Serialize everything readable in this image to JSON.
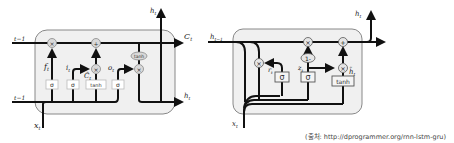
{
  "lstm": {
    "name": "LSTM cell",
    "inputs": {
      "c_prev": "cₜ₋₁",
      "h_prev": "hₜ₋₁",
      "x": "xₜ"
    },
    "outputs": {
      "c": "Cₜ",
      "h_top": "hₜ",
      "h_right": "hₜ"
    },
    "gates": [
      {
        "id": "forget",
        "box": "σ",
        "label": "fₜ"
      },
      {
        "id": "input",
        "box": "σ",
        "label": "iₜ"
      },
      {
        "id": "candidate",
        "box": "tanh",
        "label": "C̃ₜ"
      },
      {
        "id": "output",
        "box": "σ",
        "label": "oₜ"
      }
    ],
    "ops": {
      "mul": "×",
      "add": "+",
      "tanh": "tanh"
    },
    "top_left_label": "t−1",
    "bottom_left_label": "t−1"
  },
  "gru": {
    "name": "GRU cell",
    "inputs": {
      "h_prev": "hₜ₋₁",
      "x": "xₜ"
    },
    "outputs": {
      "h_top": "hₜ"
    },
    "gates": [
      {
        "id": "reset",
        "box": "σ",
        "label": "rₜ"
      },
      {
        "id": "update",
        "box": "σ",
        "label": "zₜ"
      },
      {
        "id": "candidate",
        "box": "tanh",
        "label": "h̃ₜ"
      }
    ],
    "ops": {
      "mul": "×",
      "add": "+",
      "one_minus": "1-"
    }
  },
  "caption": "(출처: http://dprogrammer.org/rnn-lstm-gru)",
  "colors": {
    "cell_fill": "#f0f0f0",
    "cell_stroke": "#888888",
    "line": "#111111",
    "op_fill": "#d9d9d9"
  }
}
